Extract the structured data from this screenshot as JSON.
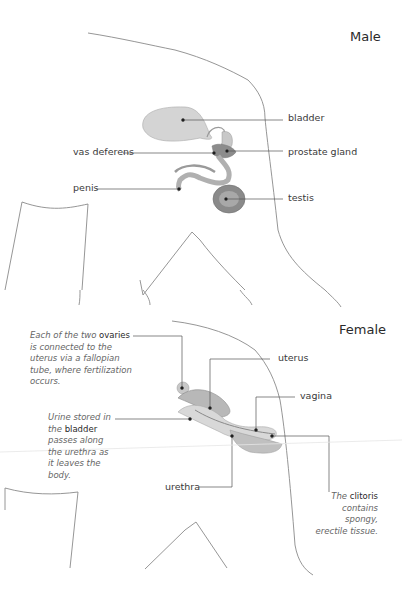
{
  "male": {
    "title": "Male",
    "labels": {
      "bladder": "bladder",
      "vas_deferens": "vas deferens",
      "prostate_gland": "prostate gland",
      "penis": "penis",
      "testis": "testis"
    }
  },
  "female": {
    "title": "Female",
    "labels": {
      "uterus": "uterus",
      "vagina": "vagina",
      "urethra": "urethra"
    },
    "notes": {
      "ovaries": {
        "pre": "Each of the two",
        "term": "ovaries",
        "post": "is connected to the uterus via a fallopian tube, where fertilization occurs."
      },
      "bladder": {
        "line1": "Urine stored in",
        "pre": "the",
        "term": "bladder",
        "post": "passes along the urethra as it leaves the body."
      },
      "clitoris": {
        "pre": "The",
        "term": "clitoris",
        "post": "contains spongy, erectile tissue."
      }
    }
  },
  "colors": {
    "outline": "#8a8a8a",
    "leader": "#555555",
    "organ_light": "#d6d6d6",
    "organ_dark": "#8c8c8c"
  }
}
